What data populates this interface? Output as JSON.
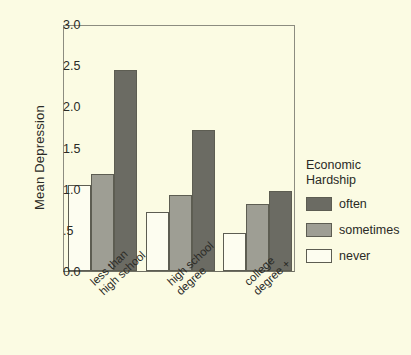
{
  "chart_data": {
    "type": "bar",
    "title": "",
    "xlabel": "",
    "ylabel": "Mean Depression",
    "categories": [
      "less than high school",
      "high school degree",
      "college degree +"
    ],
    "category_lines": [
      [
        "less than",
        "high school"
      ],
      [
        "high school",
        "degree"
      ],
      [
        "college",
        "degree +"
      ]
    ],
    "series": [
      {
        "name": "never",
        "values": [
          1.05,
          0.72,
          0.46
        ],
        "color": "#fdfdf0"
      },
      {
        "name": "sometimes",
        "values": [
          1.18,
          0.92,
          0.82
        ],
        "color": "#9e9e94"
      },
      {
        "name": "often",
        "values": [
          2.44,
          1.71,
          0.97
        ],
        "color": "#6b6b63"
      }
    ],
    "legend_order": [
      "often",
      "sometimes",
      "never"
    ],
    "ylim": [
      0.0,
      3.0
    ],
    "yticks": [
      0.0,
      0.5,
      1.0,
      1.5,
      2.0,
      2.5,
      3.0
    ],
    "ytick_labels": [
      "0.0",
      ".5",
      "1.0",
      "1.5",
      "2.0",
      "2.5",
      "3.0"
    ],
    "grid": false,
    "legend_position": "right"
  },
  "legend": {
    "title_line1": "Economic",
    "title_line2": "Hardship"
  },
  "colors": {
    "background": "#fbfbe3",
    "axis": "#6e6e62",
    "frame": "#8c8c80",
    "text": "#2a2a26",
    "often": "#6b6b63",
    "sometimes": "#9e9e94",
    "never": "#fdfdf0"
  }
}
